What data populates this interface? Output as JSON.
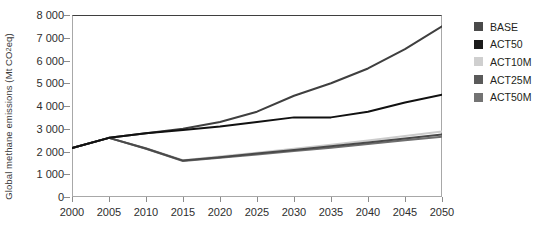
{
  "chart_data": {
    "type": "line",
    "title": "",
    "xlabel": "",
    "ylabel": "Global methane emissions (Mt CO2 eq)",
    "ylabel_prefix": "Global methane emissions (Mt CO",
    "ylabel_sub": "2",
    "ylabel_suffix": " eq)",
    "x": [
      2000,
      2005,
      2010,
      2015,
      2020,
      2025,
      2030,
      2035,
      2040,
      2045,
      2050
    ],
    "xlim": [
      2000,
      2050
    ],
    "ylim": [
      0,
      8000
    ],
    "grid": false,
    "legend_position": "right",
    "xticks": [
      "2000",
      "2005",
      "2010",
      "2015",
      "2020",
      "2025",
      "2030",
      "2035",
      "2040",
      "2045",
      "2050"
    ],
    "yticks": [
      "8 000",
      "7 000",
      "6 000",
      "5 000",
      "4 000",
      "3 000",
      "2 000",
      "1 000",
      "0"
    ],
    "ytick_values": [
      8000,
      7000,
      6000,
      5000,
      4000,
      3000,
      2000,
      1000,
      0
    ],
    "series": [
      {
        "name": "BASE",
        "color": "#3f3f3f",
        "width": 2.0,
        "values": [
          2150,
          2600,
          2800,
          3000,
          3300,
          3750,
          4450,
          5000,
          5650,
          6500,
          7500
        ]
      },
      {
        "name": "ACT50",
        "color": "#111111",
        "width": 2.0,
        "values": [
          2150,
          2600,
          2800,
          2950,
          3100,
          3300,
          3500,
          3500,
          3750,
          4150,
          4500
        ]
      },
      {
        "name": "ACT10M",
        "color": "#cccccc",
        "width": 2.0,
        "values": [
          2150,
          2600,
          2150,
          1620,
          1780,
          1950,
          2120,
          2300,
          2480,
          2680,
          2880
        ]
      },
      {
        "name": "ACT25M",
        "color": "#4a4a4a",
        "width": 2.0,
        "values": [
          2150,
          2600,
          2130,
          1600,
          1750,
          1910,
          2070,
          2230,
          2400,
          2570,
          2750
        ]
      },
      {
        "name": "ACT50M",
        "color": "#6e6e6e",
        "width": 2.0,
        "values": [
          2150,
          2600,
          2120,
          1580,
          1720,
          1870,
          2020,
          2170,
          2330,
          2490,
          2650
        ]
      }
    ]
  },
  "legend": {
    "items": [
      {
        "label": "BASE",
        "color": "#4a4a4a"
      },
      {
        "label": "ACT50",
        "color": "#1b1b1b"
      },
      {
        "label": "ACT10M",
        "color": "#cfcfcf"
      },
      {
        "label": "ACT25M",
        "color": "#5a5a5a"
      },
      {
        "label": "ACT50M",
        "color": "#737373"
      }
    ]
  }
}
